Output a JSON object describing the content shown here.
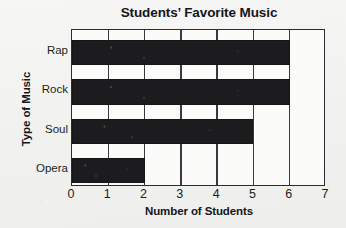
{
  "chart_data": {
    "type": "bar",
    "orientation": "horizontal",
    "title": "Students’ Favorite Music",
    "xlabel": "Number of Students",
    "ylabel": "Type of Music",
    "categories": [
      "Rap",
      "Rock",
      "Soul",
      "Opera"
    ],
    "values": [
      6,
      6,
      5,
      2
    ],
    "x_ticks": [
      "0",
      "1",
      "2",
      "3",
      "4",
      "5",
      "6",
      "7"
    ],
    "xlim": [
      0,
      7
    ],
    "grid": "vertical",
    "legend": "none",
    "bar_color": "#1c1c1e",
    "plot_background": "#fbfbf9",
    "axis_color": "#2c2c30",
    "text_color": "#15151a",
    "page_background": "#f3f3f1"
  }
}
